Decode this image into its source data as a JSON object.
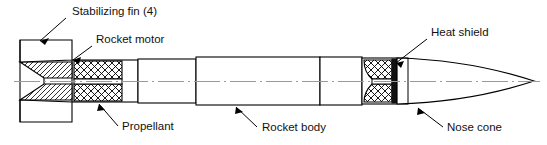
{
  "figure": {
    "type": "engineering-cutaway-diagram",
    "line_color": "#000000",
    "centerline_color": "#9a9a9a",
    "background_color": "#ffffff",
    "heat_shield_fill": "#111111"
  },
  "labels": {
    "stabilizing_fin": "Stabilizing fin (4)",
    "rocket_motor": "Rocket motor",
    "propellant": "Propellant",
    "rocket_body": "Rocket body",
    "heat_shield": "Heat shield",
    "nose_cone": "Nose cone"
  },
  "callouts": [
    {
      "key": "stabilizing_fin",
      "text_x": 72,
      "text_y": 15,
      "leader": "M66,18 L40,41"
    },
    {
      "key": "rocket_motor",
      "text_x": 96,
      "text_y": 43,
      "leader": "M92,46 L73,60"
    },
    {
      "key": "propellant",
      "text_x": 122,
      "text_y": 130,
      "leader": "M118,126 L99,104"
    },
    {
      "key": "rocket_body",
      "text_x": 262,
      "text_y": 131,
      "leader": "M257,127 L236,107"
    },
    {
      "key": "heat_shield",
      "text_x": 431,
      "text_y": 36,
      "leader": "M427,39 L396,63"
    },
    {
      "key": "nose_cone",
      "text_x": 447,
      "text_y": 131,
      "leader": "M443,127 L418,108"
    }
  ]
}
